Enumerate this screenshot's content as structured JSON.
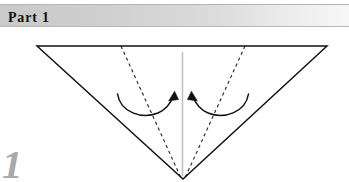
{
  "page": {
    "background_color": "#ffffff",
    "width": 349,
    "height": 182
  },
  "header": {
    "title": "Part 1",
    "background_gradient_from": "#c9c9c9",
    "background_gradient_to": "#f7f7f7",
    "text_color": "#111111"
  },
  "figure": {
    "caption_number": "1",
    "caption_color": "#a9a9a9",
    "solid_line_color": "#101010",
    "dashed_line_color": "#2a2a2a",
    "center_line_color": "#c2c2c2",
    "arrow_color": "#101010",
    "shapes": {
      "triangle": {
        "type": "polygon",
        "points": "37,19 327,19 183,152",
        "stroke": "#101010",
        "stroke_width": 1.4,
        "fill": "none"
      },
      "center_line": {
        "type": "line",
        "x1": 182.5,
        "y1": 25,
        "x2": 182.5,
        "y2": 149,
        "stroke": "#c2c2c2",
        "stroke_width": 1.6
      },
      "fold_line_left": {
        "type": "line",
        "x1": 121,
        "y1": 19,
        "x2": 181,
        "y2": 151,
        "stroke": "#2a2a2a",
        "stroke_width": 1.2,
        "dash": "3.2 3.2"
      },
      "fold_line_right": {
        "type": "line",
        "x1": 245,
        "y1": 19,
        "x2": 185,
        "y2": 151,
        "stroke": "#2a2a2a",
        "stroke_width": 1.2,
        "dash": "3.2 3.2"
      },
      "arrow_left": {
        "type": "arc-arrow",
        "path": "M 117.5,67 C 120,85 142,92 158,86 C 166,83 171,75 173.5,68.5",
        "head_points": "173.5,65.5 169.4,73.4 178.2,72.2",
        "stroke": "#101010",
        "stroke_width": 1.5,
        "direction": "clockwise-up-right"
      },
      "arrow_right": {
        "type": "arc-arrow",
        "path": "M 248.5,67 C 246,85 224,92 208,86 C 200,83 195,75 192.5,68.5",
        "head_points": "192.5,65.5 187.8,72.2 196.6,73.4",
        "stroke": "#101010",
        "stroke_width": 1.5,
        "direction": "counter-clockwise-up-left"
      }
    }
  }
}
